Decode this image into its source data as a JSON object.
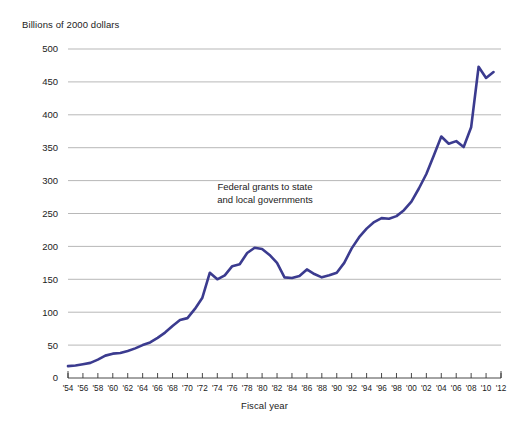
{
  "chart_data": {
    "type": "line",
    "title": "",
    "subtitle": "",
    "ylabel": "Billions of 2000 dollars",
    "xlabel": "Fiscal year",
    "ylim": [
      0,
      500
    ],
    "xlim": [
      1954,
      2012
    ],
    "grid": true,
    "legend_position": "none",
    "y_ticks": [
      0,
      50,
      100,
      150,
      200,
      250,
      300,
      350,
      400,
      450,
      500
    ],
    "y_tick_labels": [
      "0",
      "50",
      "100",
      "150",
      "200",
      "250",
      "300",
      "350",
      "400",
      "450",
      "500"
    ],
    "x_ticks": [
      1954,
      1956,
      1958,
      1960,
      1962,
      1964,
      1966,
      1968,
      1970,
      1972,
      1974,
      1976,
      1978,
      1980,
      1982,
      1984,
      1986,
      1988,
      1990,
      1992,
      1994,
      1996,
      1998,
      2000,
      2002,
      2004,
      2006,
      2008,
      2010,
      2012
    ],
    "x_tick_labels": [
      "'54",
      "'56",
      "'58",
      "'60",
      "'62",
      "'64",
      "'66",
      "'68",
      "'70",
      "'72",
      "'74",
      "'76",
      "'78",
      "'80",
      "'82",
      "'84",
      "'86",
      "'88",
      "'90",
      "'92",
      "'94",
      "'96",
      "'98",
      "'00",
      "'02",
      "'04",
      "'06",
      "'08",
      "'10",
      "'12"
    ],
    "annotations": [
      {
        "text_line1": "Federal grants to state",
        "text_line2": "and local governments",
        "x": 1977,
        "y": 272
      }
    ],
    "series": [
      {
        "name": "Federal grants to state and local governments",
        "color": "#3b3b8f",
        "x": [
          1954,
          1955,
          1956,
          1957,
          1958,
          1959,
          1960,
          1961,
          1962,
          1963,
          1964,
          1965,
          1966,
          1967,
          1968,
          1969,
          1970,
          1971,
          1972,
          1973,
          1974,
          1975,
          1976,
          1977,
          1978,
          1979,
          1980,
          1981,
          1982,
          1983,
          1984,
          1985,
          1986,
          1987,
          1988,
          1989,
          1990,
          1991,
          1992,
          1993,
          1994,
          1995,
          1996,
          1997,
          1998,
          1999,
          2000,
          2001,
          2002,
          2003,
          2004,
          2005,
          2006,
          2007,
          2008,
          2009,
          2010,
          2011
        ],
        "values": [
          18,
          19,
          21,
          23,
          28,
          34,
          37,
          38,
          41,
          45,
          50,
          54,
          61,
          69,
          79,
          88,
          91,
          105,
          122,
          160,
          150,
          156,
          170,
          173,
          190,
          198,
          196,
          187,
          175,
          153,
          152,
          155,
          165,
          158,
          153,
          156,
          160,
          175,
          197,
          214,
          227,
          237,
          243,
          242,
          246,
          255,
          268,
          288,
          310,
          338,
          367,
          356,
          360,
          351,
          381,
          473,
          456,
          465
        ]
      }
    ]
  },
  "geometry": {
    "plot_left": 68,
    "plot_right": 501,
    "plot_top": 49,
    "plot_bottom": 378
  }
}
